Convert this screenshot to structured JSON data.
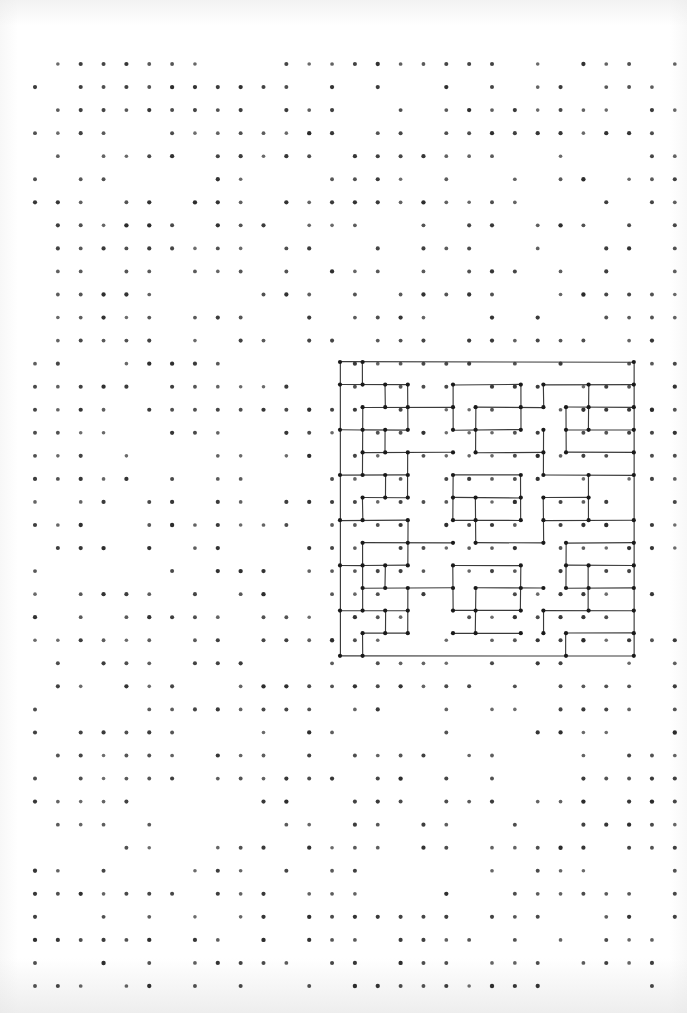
{
  "page": {
    "kind": "scanned-dot-grid-notebook-page",
    "width": 687,
    "height": 1013,
    "background_color": "#ffffff",
    "paper_tint": "#f2f2f2"
  },
  "dot_grid": {
    "name": "dot-grid",
    "dot_color": "#2b2b2b",
    "dot_radius": 1.9,
    "spacing_x": 22.85,
    "spacing_y": 23.05,
    "origin_x": 35,
    "origin_y": 64,
    "cols": 29,
    "rows": 41,
    "note": "printed guide dots; scan causes many dots to render faintly or drop out"
  },
  "drawing": {
    "name": "fractal-maze-drawing",
    "title": "",
    "ink_color": "#3a3a3a",
    "node_color": "#1a1a1a",
    "stroke_width": 1.15,
    "node_radius": 2.1,
    "origin_x": 340,
    "origin_y": 362,
    "cell": 22.6,
    "grid_cols": 13,
    "grid_rows": 13,
    "description": "Hand-drawn self-similar rectilinear maze / space-filling pattern on a 14x14 lattice of dots"
  },
  "chart_data": {
    "type": "scatter",
    "title": "",
    "xlabel": "",
    "ylabel": "",
    "grid": true,
    "legend": "none",
    "series": [
      {
        "name": "dot-grid-points",
        "description": "printed guide dot lattice",
        "nx": 29,
        "ny": 41,
        "dx": 22.85,
        "dy": 23.05,
        "x0": 35,
        "y0": 64
      },
      {
        "name": "maze-vertices",
        "description": "lattice nodes of the hand-drawn pattern",
        "nx": 14,
        "ny": 14,
        "dx": 22.6,
        "dy": 22.6,
        "x0": 340,
        "y0": 362
      }
    ],
    "maze_segments_h": [
      [
        0,
        0,
        13
      ],
      [
        0,
        1,
        3
      ],
      [
        5,
        1,
        8
      ],
      [
        9,
        1,
        13
      ],
      [
        1,
        2,
        5
      ],
      [
        6,
        2,
        9
      ],
      [
        10,
        2,
        13
      ],
      [
        0,
        3,
        1
      ],
      [
        1,
        3,
        3
      ],
      [
        5,
        3,
        8
      ],
      [
        10,
        3,
        13
      ],
      [
        1,
        4,
        5
      ],
      [
        6,
        4,
        9
      ],
      [
        10,
        4,
        13
      ],
      [
        0,
        5,
        3
      ],
      [
        5,
        5,
        8
      ],
      [
        9,
        5,
        13
      ],
      [
        1,
        6,
        3
      ],
      [
        5,
        6,
        8
      ],
      [
        9,
        6,
        11
      ],
      [
        0,
        7,
        3
      ],
      [
        5,
        7,
        8
      ],
      [
        9,
        7,
        13
      ],
      [
        1,
        8,
        5
      ],
      [
        6,
        8,
        9
      ],
      [
        10,
        8,
        13
      ],
      [
        0,
        9,
        1
      ],
      [
        1,
        9,
        3
      ],
      [
        5,
        9,
        8
      ],
      [
        10,
        9,
        13
      ],
      [
        1,
        10,
        5
      ],
      [
        6,
        10,
        9
      ],
      [
        10,
        10,
        13
      ],
      [
        0,
        11,
        3
      ],
      [
        5,
        11,
        8
      ],
      [
        9,
        11,
        13
      ],
      [
        1,
        12,
        3
      ],
      [
        5,
        12,
        8
      ],
      [
        10,
        12,
        13
      ],
      [
        0,
        13,
        13
      ]
    ],
    "maze_segments_v": [
      [
        0,
        0,
        13
      ],
      [
        1,
        0,
        1
      ],
      [
        1,
        2,
        5
      ],
      [
        1,
        6,
        7
      ],
      [
        1,
        8,
        11
      ],
      [
        1,
        12,
        13
      ],
      [
        2,
        1,
        2
      ],
      [
        2,
        3,
        4
      ],
      [
        2,
        5,
        6
      ],
      [
        2,
        9,
        10
      ],
      [
        2,
        11,
        12
      ],
      [
        3,
        1,
        3
      ],
      [
        3,
        4,
        6
      ],
      [
        3,
        7,
        9
      ],
      [
        3,
        10,
        12
      ],
      [
        5,
        1,
        3
      ],
      [
        5,
        5,
        7
      ],
      [
        5,
        9,
        11
      ],
      [
        6,
        2,
        4
      ],
      [
        6,
        6,
        8
      ],
      [
        6,
        10,
        12
      ],
      [
        8,
        1,
        3
      ],
      [
        8,
        5,
        7
      ],
      [
        8,
        9,
        11
      ],
      [
        9,
        1,
        2
      ],
      [
        9,
        3,
        5
      ],
      [
        9,
        6,
        8
      ],
      [
        9,
        11,
        12
      ],
      [
        10,
        2,
        4
      ],
      [
        10,
        8,
        10
      ],
      [
        10,
        12,
        13
      ],
      [
        11,
        1,
        3
      ],
      [
        11,
        5,
        7
      ],
      [
        11,
        9,
        11
      ],
      [
        13,
        0,
        13
      ]
    ]
  }
}
